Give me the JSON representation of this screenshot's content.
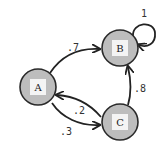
{
  "diagram": {
    "type": "markov-chain",
    "nodes": [
      {
        "id": "A",
        "label": "A",
        "x": 38,
        "y": 87
      },
      {
        "id": "B",
        "label": "B",
        "x": 120,
        "y": 48
      },
      {
        "id": "C",
        "label": "C",
        "x": 120,
        "y": 122
      }
    ],
    "edges": [
      {
        "from": "A",
        "to": "B",
        "label": ".7"
      },
      {
        "from": "B",
        "to": "B",
        "label": "1"
      },
      {
        "from": "C",
        "to": "B",
        "label": ".8"
      },
      {
        "from": "C",
        "to": "A",
        "label": ".2"
      },
      {
        "from": "A",
        "to": "C",
        "label": ".3"
      }
    ],
    "colors": {
      "node_fill": "#bdbdbd",
      "node_stroke": "#2a2a2a",
      "label_box": "#f4f4f4",
      "edge": "#222222"
    }
  }
}
